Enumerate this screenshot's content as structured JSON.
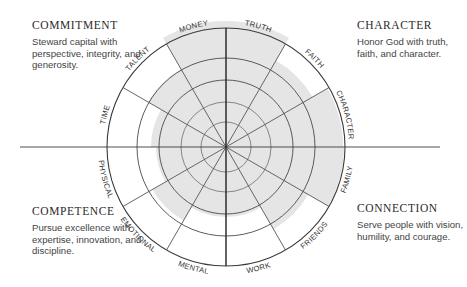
{
  "quadrants": {
    "commitment": {
      "title": "COMMITMENT",
      "description": "Steward capital with perspective, integrity, and generosity."
    },
    "character": {
      "title": "CHARACTER",
      "description": "Honor God with truth, faith, and character."
    },
    "competence": {
      "title": "COMPETENCE",
      "description": "Pursue excellence with expertise, innovation, and discipline."
    },
    "connection": {
      "title": "CONNECTION",
      "description": "Serve people with vision, humility, and courage."
    }
  },
  "wheel": {
    "center": [
      226,
      147
    ],
    "ring_radii": [
      25,
      45,
      67,
      89,
      119
    ],
    "colors": {
      "lines": "#3a3a3a",
      "inner_lines": "#7a7a7a",
      "fill": "#e4e4e4"
    },
    "segments": [
      {
        "label": "TRUTH",
        "fill_radius": 126
      },
      {
        "label": "FAITH",
        "fill_radius": 100
      },
      {
        "label": "CHARACTER",
        "fill_radius": 117
      },
      {
        "label": "FAMILY",
        "fill_radius": 118
      },
      {
        "label": "FRIENDS",
        "fill_radius": 95
      },
      {
        "label": "WORK",
        "fill_radius": 70
      },
      {
        "label": "MENTAL",
        "fill_radius": 70
      },
      {
        "label": "EMOTIONAL",
        "fill_radius": 85
      },
      {
        "label": "PHYSICAL",
        "fill_radius": 70
      },
      {
        "label": "TIME",
        "fill_radius": 75
      },
      {
        "label": "TALENT",
        "fill_radius": 90
      },
      {
        "label": "MONEY",
        "fill_radius": 126
      }
    ]
  }
}
